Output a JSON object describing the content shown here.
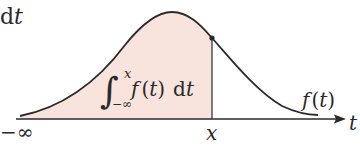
{
  "diagram": {
    "type": "cumulative-area-under-density-curve",
    "colors": {
      "curve": "#2a2a2a",
      "fill": "#f8e4dc",
      "axis": "#2a2a2a",
      "background": "#ffffff"
    },
    "top_left_fragment": {
      "d": "d",
      "t": "t"
    },
    "integral_label": {
      "sign": "∫",
      "upper": "x",
      "lower": "−∞",
      "integrand": "f",
      "arg_open": "(",
      "arg": "t",
      "arg_close": ")",
      "differential_d": "d",
      "differential_var": "t"
    },
    "curve_label": {
      "f": "f",
      "open": "(",
      "var": "t",
      "close": ")"
    },
    "axis_labels": {
      "left": "−∞",
      "point": "x",
      "axis_var": "t"
    }
  }
}
